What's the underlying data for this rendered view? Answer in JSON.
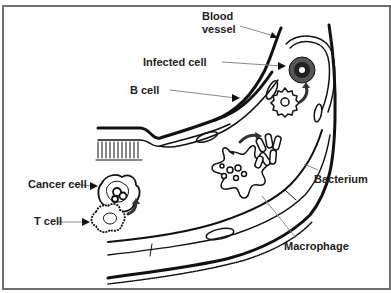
{
  "diagram": {
    "frame_color": "#6e6e6e",
    "line_color": "#111111",
    "leader_color": "#888888",
    "labels": {
      "blood_vessel_line1": "Blood",
      "blood_vessel_line2": "vessel",
      "infected_cell": "Infected cell",
      "b_cell": "B cell",
      "cancer_cell": "Cancer cell",
      "t_cell": "T cell",
      "bacterium": "Bacterium",
      "macrophage": "Macrophage"
    }
  }
}
